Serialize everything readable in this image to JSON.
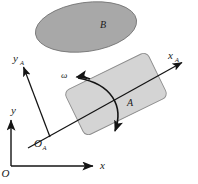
{
  "figure": {
    "labels": {
      "global_origin": "O",
      "global_x": "x",
      "global_y": "y",
      "body_origin": "O",
      "body_origin_sub": "A",
      "body_x": "x",
      "body_x_sub": "A",
      "body_y": "y",
      "body_y_sub": "A",
      "body_a": "A",
      "body_b": "B",
      "angular_velocity": "ω"
    },
    "colors": {
      "background": "#ffffff",
      "ellipse_fill": "#a8a8a8",
      "ellipse_stroke": "#6e6e6e",
      "rect_fill": "#d4d4d4",
      "rect_stroke": "#8c8c8c",
      "line": "#141414",
      "text": "#1a1a1a"
    },
    "geometry": {
      "ellipse": {
        "cx": 86,
        "cy": 27,
        "rx": 51,
        "ry": 24.5,
        "rotation": -8
      },
      "rect": {
        "cx": 116,
        "cy": 94,
        "w": 92,
        "h": 50,
        "rotation": -26,
        "corner_radius": 6
      },
      "global_axes": {
        "origin": [
          11,
          166
        ],
        "x_tip": [
          95,
          166
        ],
        "y_tip": [
          11,
          118
        ]
      },
      "body_axes": {
        "origin": [
          50,
          137
        ],
        "x_tip": [
          184,
          62
        ],
        "y_tip": [
          22,
          66
        ]
      },
      "omega_arc": {
        "start": [
          77,
          78
        ],
        "end": [
          116,
          133
        ],
        "control": [
          133,
          92
        ]
      }
    }
  }
}
